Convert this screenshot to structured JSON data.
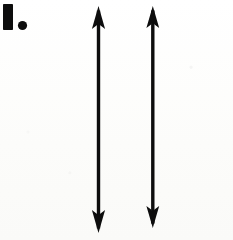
{
  "figure": {
    "label": "I.",
    "label_letter": "I",
    "label_period": ".",
    "caption": "",
    "background_color": "#fdfdfc",
    "ink_color": "#0d0d0d",
    "width": 233,
    "height": 240
  },
  "label_mark": {
    "name": "roman-numeral-one-with-period",
    "bar": {
      "x": 3,
      "y": 4,
      "width": 10,
      "height": 26
    },
    "dot": {
      "cx": 22.5,
      "cy": 25.5,
      "r": 4.6
    }
  },
  "arrows": [
    {
      "id": "left-arrow",
      "name": "Left double-headed arrow",
      "shaft_x": 98.5,
      "top_tip_y": 6,
      "bottom_tip_y": 233,
      "shaft_width": 3.4,
      "head_half_width": 6.6,
      "head_length": 23,
      "total_length": 227
    },
    {
      "id": "right-arrow",
      "name": "Right double-headed arrow",
      "shaft_x": 152.8,
      "top_tip_y": 6,
      "bottom_tip_y": 228,
      "shaft_width": 3.4,
      "head_half_width": 6.4,
      "head_length": 22,
      "total_length": 222
    }
  ]
}
